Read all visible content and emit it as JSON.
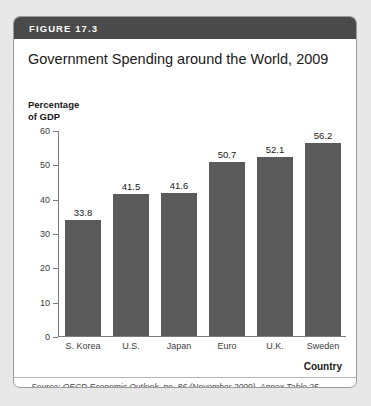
{
  "figure": {
    "header_label": "FIGURE 17.3",
    "title": "Government Spending around the World, 2009",
    "source_note": "Source: OECD Economic Outlook, no. 86 (November 2009), Annex Table 25."
  },
  "colors": {
    "header_bar": "#4a4a4a",
    "bar_fill": "#5a5a5a",
    "axis": "#7d7d7d",
    "card_background": "#ffffff",
    "page_background": "#e8e8e8"
  },
  "chart_data": {
    "type": "bar",
    "title": "Government Spending around the World, 2009",
    "categories": [
      "S. Korea",
      "U.S.",
      "Japan",
      "Euro",
      "U.K.",
      "Sweden"
    ],
    "values": [
      33.8,
      41.5,
      41.6,
      50.7,
      52.1,
      56.2
    ],
    "value_labels": [
      "33.8",
      "41.5",
      "41.6",
      "50.7",
      "52.1",
      "56.2"
    ],
    "xlabel": "Country",
    "ylabel": "Percentage\nof GDP",
    "ylim": [
      0,
      60
    ],
    "yticks": [
      0,
      10,
      20,
      30,
      40,
      50,
      60
    ],
    "ytick_labels": [
      "0",
      "10",
      "20",
      "30",
      "40",
      "50",
      "60"
    ],
    "grid": false,
    "legend": null
  }
}
